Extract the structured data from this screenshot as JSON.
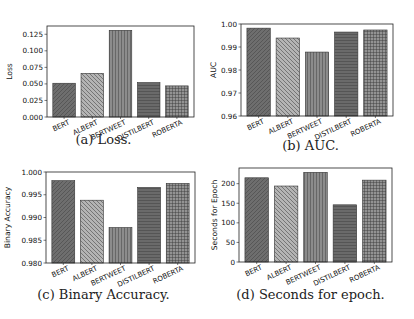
{
  "figure": {
    "captions": {
      "a": "(a) Loss.",
      "b": "(b) AUC.",
      "c": "(c) Binary Accuracy.",
      "d": "(d) Seconds for epoch."
    },
    "bar_styles": [
      {
        "model": "BERT",
        "fill": "#6e6e6e",
        "hatch": "diag-fwd"
      },
      {
        "model": "ALBERT",
        "fill": "#b4b4b4",
        "hatch": "diag-back"
      },
      {
        "model": "BERTWEET",
        "fill": "#8c8c8c",
        "hatch": "vertical"
      },
      {
        "model": "DISTILBERT",
        "fill": "#6a6a6a",
        "hatch": "horizontal"
      },
      {
        "model": "ROBERTA",
        "fill": "#939393",
        "hatch": "grid"
      }
    ]
  },
  "chart_data": [
    {
      "id": "a",
      "type": "bar",
      "title": "",
      "caption": "(a) Loss.",
      "xlabel": "",
      "ylabel": "Loss",
      "categories": [
        "BERT",
        "ALBERT",
        "BERTWEET",
        "DISTILBERT",
        "ROBERTA"
      ],
      "values": [
        0.051,
        0.066,
        0.131,
        0.052,
        0.047
      ],
      "ylim": [
        0.0,
        0.1375
      ],
      "yticks": [
        0.0,
        0.025,
        0.05,
        0.075,
        0.1,
        0.125
      ],
      "ytick_labels": [
        "0.000",
        "0.025",
        "0.050",
        "0.075",
        "0.100",
        "0.125"
      ],
      "grid": false,
      "legend": null
    },
    {
      "id": "b",
      "type": "bar",
      "title": "",
      "caption": "(b) AUC.",
      "xlabel": "",
      "ylabel": "AUC",
      "categories": [
        "BERT",
        "ALBERT",
        "BERTWEET",
        "DISTILBERT",
        "ROBERTA"
      ],
      "values": [
        0.9982,
        0.9939,
        0.9878,
        0.9965,
        0.9974
      ],
      "ylim": [
        0.96,
        1.0
      ],
      "yticks": [
        0.96,
        0.97,
        0.98,
        0.99,
        1.0
      ],
      "ytick_labels": [
        "0.96",
        "0.97",
        "0.98",
        "0.99",
        "1.00"
      ],
      "grid": false,
      "legend": null
    },
    {
      "id": "c",
      "type": "bar",
      "title": "",
      "caption": "(c) Binary Accuracy.",
      "xlabel": "",
      "ylabel": "Binary Accuracy",
      "categories": [
        "BERT",
        "ALBERT",
        "BERTWEET",
        "DISTILBERT",
        "ROBERTA"
      ],
      "values": [
        0.9981,
        0.9938,
        0.9878,
        0.9966,
        0.9975
      ],
      "ylim": [
        0.98,
        1.0
      ],
      "yticks": [
        0.98,
        0.985,
        0.99,
        0.995,
        1.0
      ],
      "ytick_labels": [
        "0.980",
        "0.985",
        "0.990",
        "0.995",
        "1.000"
      ],
      "grid": false,
      "legend": null
    },
    {
      "id": "d",
      "type": "bar",
      "title": "",
      "caption": "(d) Seconds for epoch.",
      "xlabel": "",
      "ylabel": "Seconds for Epoch",
      "categories": [
        "BERT",
        "ALBERT",
        "BERTWEET",
        "DISTILBERT",
        "ROBERTA"
      ],
      "values": [
        215,
        194,
        229,
        146,
        209
      ],
      "ylim": [
        0,
        240
      ],
      "yticks": [
        0,
        50,
        100,
        150,
        200
      ],
      "ytick_labels": [
        "0",
        "50",
        "100",
        "150",
        "200"
      ],
      "grid": false,
      "legend": null
    }
  ]
}
